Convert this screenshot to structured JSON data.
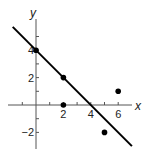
{
  "chart_data": {
    "type": "scatter",
    "title": "",
    "xlabel": "x",
    "ylabel": "y",
    "xlim": [
      -2,
      7
    ],
    "ylim": [
      -3,
      6
    ],
    "grid": false,
    "legend": null,
    "x_ticks": [
      -1,
      1,
      2,
      3,
      4,
      5,
      6
    ],
    "x_tick_labels": [
      {
        "value": 2,
        "label": "2"
      },
      {
        "value": 4,
        "label": "4"
      },
      {
        "value": 6,
        "label": "6"
      }
    ],
    "y_ticks": [
      -2,
      -1,
      1,
      2,
      3,
      4,
      5
    ],
    "y_tick_labels": [
      {
        "value": 4,
        "label": "4"
      },
      {
        "value": 2,
        "label": "2"
      },
      {
        "value": -2,
        "label": "−2"
      }
    ],
    "series": [
      {
        "name": "data points",
        "type": "scatter",
        "points": [
          {
            "x": 0,
            "y": 4
          },
          {
            "x": 2,
            "y": 2
          },
          {
            "x": 2,
            "y": 0
          },
          {
            "x": 5,
            "y": -2
          },
          {
            "x": 6,
            "y": 1
          }
        ]
      },
      {
        "name": "fitted line",
        "type": "line",
        "equation": "y = -x + 4",
        "slope": -1,
        "intercept": 4,
        "x_range": [
          -1.7,
          7.0
        ]
      }
    ]
  },
  "colors": {
    "axis": "#555555",
    "line": "#000000",
    "points": "#000000"
  }
}
